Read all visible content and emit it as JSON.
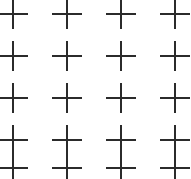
{
  "figure": {
    "type": "line-grid",
    "width": 191,
    "height": 179,
    "background_color": "#ffffff",
    "line_color": "#2b2b2b",
    "line_width": 2
  },
  "chart_data": {
    "type": "line",
    "xlabel": "",
    "ylabel": "",
    "xlim": [
      0,
      191
    ],
    "ylim": [
      0,
      179
    ],
    "grid": true,
    "legend": "none",
    "vertical_line_x": [
      13,
      67,
      121,
      175
    ],
    "horizontal_line_y": [
      14,
      56,
      98,
      140,
      168
    ],
    "cell_width": 54,
    "cell_height": 42,
    "stroke_half_length": 15,
    "gap_half_length": 12,
    "node_count": 20,
    "columns": 4,
    "rows": 5
  }
}
